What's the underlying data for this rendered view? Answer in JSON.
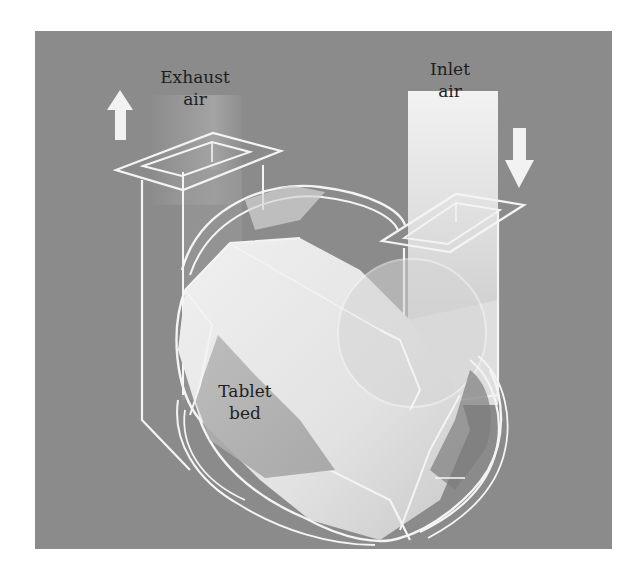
{
  "figure": {
    "background_color": "#8b8b8b",
    "outline_color": "#f4f4f4",
    "text_color": "#1e1e1e"
  },
  "labels": {
    "exhaust": {
      "line1": "Exhaust",
      "line2": "air"
    },
    "inlet": {
      "line1": "Inlet",
      "line2": "air"
    },
    "tablet_bed": {
      "line1": "Tablet",
      "line2": "bed"
    }
  },
  "arrows": {
    "exhaust_arrow": {
      "direction": "up",
      "icon": "arrow-up-icon"
    },
    "inlet_arrow": {
      "direction": "down",
      "icon": "arrow-down-icon"
    }
  },
  "components": [
    {
      "name": "exhaust-duct",
      "label": "Exhaust air"
    },
    {
      "name": "inlet-duct",
      "label": "Inlet air"
    },
    {
      "name": "coating-pan",
      "label": "Drum"
    },
    {
      "name": "tablet-bed",
      "label": "Tablet bed"
    }
  ]
}
